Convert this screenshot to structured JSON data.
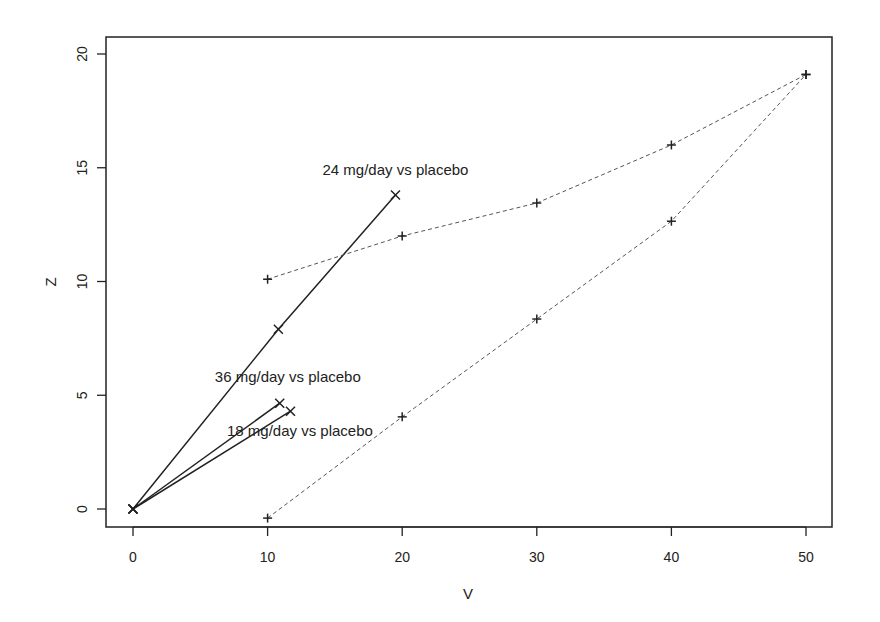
{
  "chart_data": {
    "type": "line",
    "title": "",
    "xlabel": "V",
    "ylabel": "Z",
    "xlim": [
      -2,
      52
    ],
    "ylim": [
      -0.8,
      21
    ],
    "xticks": [
      0,
      10,
      20,
      30,
      40,
      50
    ],
    "yticks": [
      0,
      5,
      10,
      15,
      20
    ],
    "grid": false,
    "legend": null,
    "series": [
      {
        "name": "24 mg/day vs placebo",
        "style": "solid",
        "marker": "x",
        "points": [
          [
            0,
            0
          ],
          [
            10.8,
            7.9
          ],
          [
            19.5,
            13.8
          ]
        ]
      },
      {
        "name": "36 mg/day vs placebo",
        "style": "solid",
        "marker": "x",
        "points": [
          [
            0,
            0
          ],
          [
            10.9,
            4.65
          ]
        ]
      },
      {
        "name": "18 mg/day vs placebo",
        "style": "solid",
        "marker": "x",
        "points": [
          [
            0,
            0
          ],
          [
            11.7,
            4.3
          ]
        ]
      },
      {
        "name": "Upper stopping boundary",
        "style": "dashed",
        "marker": "+",
        "points": [
          [
            10,
            10.1
          ],
          [
            20,
            12.0
          ],
          [
            30,
            13.45
          ],
          [
            40,
            16.0
          ],
          [
            50,
            19.1
          ]
        ]
      },
      {
        "name": "Lower stopping boundary",
        "style": "dashed",
        "marker": "+",
        "points": [
          [
            10,
            -0.4
          ],
          [
            20,
            4.05
          ],
          [
            30,
            8.35
          ],
          [
            40,
            12.65
          ],
          [
            50,
            19.1
          ]
        ]
      }
    ],
    "annotations": [
      {
        "text": "24 mg/day vs placebo",
        "x": 19.5,
        "y": 14.7
      },
      {
        "text": "36 mg/day vs placebo",
        "x": 11.5,
        "y": 5.6
      },
      {
        "text": "18 mg/day vs placebo",
        "x": 12.4,
        "y": 3.2
      }
    ]
  },
  "colors": {
    "axis": "#222222",
    "solid_line": "#222222",
    "dashed_line": "#555555",
    "marker": "#222222"
  }
}
